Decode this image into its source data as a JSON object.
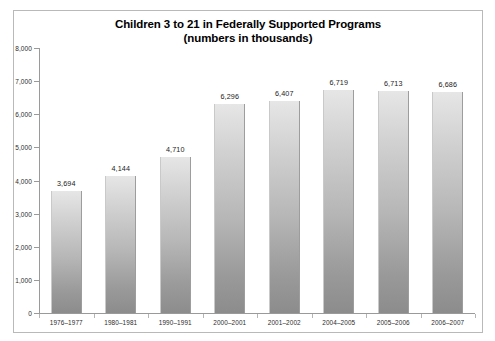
{
  "chart_data": {
    "type": "bar",
    "title": "Children 3 to 21 in Federally Supported Programs",
    "subtitle": "(numbers in thousands)",
    "xlabel": "",
    "ylabel": "",
    "ylim": [
      0,
      8000
    ],
    "yticks": [
      0,
      1000,
      2000,
      3000,
      4000,
      5000,
      6000,
      7000,
      8000
    ],
    "ytick_labels": [
      "0",
      "1,000",
      "2,000",
      "3,000",
      "4,000",
      "5,000",
      "6,000",
      "7,000",
      "8,000"
    ],
    "grid": false,
    "legend": null,
    "categories": [
      "1976–1977",
      "1980–1981",
      "1990–1991",
      "2000–2001",
      "2001–2002",
      "2004–2005",
      "2005–2006",
      "2006–2007"
    ],
    "values": [
      3694,
      4144,
      4710,
      6296,
      6407,
      6719,
      6713,
      6686
    ],
    "value_labels": [
      "3,694",
      "4,144",
      "4,710",
      "6,296",
      "6,407",
      "6,719",
      "6,713",
      "6,686"
    ],
    "series": [
      {
        "name": "Children served",
        "values": [
          3694,
          4144,
          4710,
          6296,
          6407,
          6719,
          6713,
          6686
        ]
      }
    ],
    "colors": {
      "bar_top": "#e6e6e6",
      "bar_bottom": "#8c8c8c",
      "axis": "#9a9a9a",
      "text": "#1a1a1a",
      "frame": "#b9b9b9",
      "background": "#ffffff"
    }
  }
}
